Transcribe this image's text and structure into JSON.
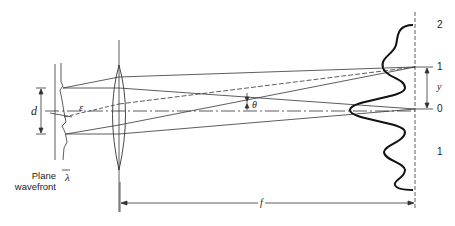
{
  "diagram": {
    "type": "optics - diffraction grating focused by lens onto screen",
    "labels": {
      "d": "d",
      "epsilon": "ε",
      "lambda": "λ",
      "theta": "θ",
      "y": "y",
      "f": "f",
      "plane_wavefront_line1": "Plane",
      "plane_wavefront_line2": "wavefront"
    },
    "orders": [
      {
        "label": "2",
        "y": 25
      },
      {
        "label": "1",
        "y": 67
      },
      {
        "label": "0",
        "y": 109
      },
      {
        "label": "1",
        "y": 152
      }
    ],
    "colors": {
      "line": "#333333",
      "curve": "#111111",
      "background": "#ffffff"
    }
  }
}
